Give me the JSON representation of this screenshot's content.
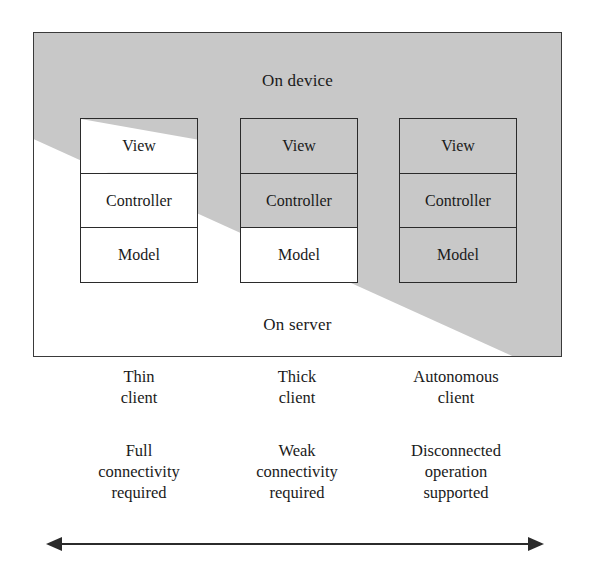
{
  "diagram": {
    "frame": {
      "device_region_label": "On device",
      "server_region_label": "On server",
      "shade_color": "#c8c8c8",
      "line_color": "#2b2b2b",
      "background_color": "#ffffff"
    },
    "layer_names": {
      "view": "View",
      "controller": "Controller",
      "model": "Model"
    },
    "stacks": [
      {
        "id": "thin-client",
        "cells": [
          {
            "label": "View",
            "location": "split"
          },
          {
            "label": "Controller",
            "location": "server"
          },
          {
            "label": "Model",
            "location": "server"
          }
        ]
      },
      {
        "id": "thick-client",
        "cells": [
          {
            "label": "View",
            "location": "device"
          },
          {
            "label": "Controller",
            "location": "device"
          },
          {
            "label": "Model",
            "location": "server"
          }
        ]
      },
      {
        "id": "autonomous-client",
        "cells": [
          {
            "label": "View",
            "location": "device"
          },
          {
            "label": "Controller",
            "location": "device"
          },
          {
            "label": "Model",
            "location": "device"
          }
        ]
      }
    ],
    "columns": [
      {
        "id": "thin-client",
        "title": "Thin\nclient",
        "note": "Full\nconnectivity\nrequired"
      },
      {
        "id": "thick-client",
        "title": "Thick\nclient",
        "note": "Weak\nconnectivity\nrequired"
      },
      {
        "id": "autonomous-client",
        "title": "Autonomous\nclient",
        "note": "Disconnected\noperation\nsupported"
      }
    ],
    "arrow": {
      "name": "connectivity-spectrum-arrow",
      "style": "double-headed",
      "color": "#2b2b2b"
    }
  }
}
